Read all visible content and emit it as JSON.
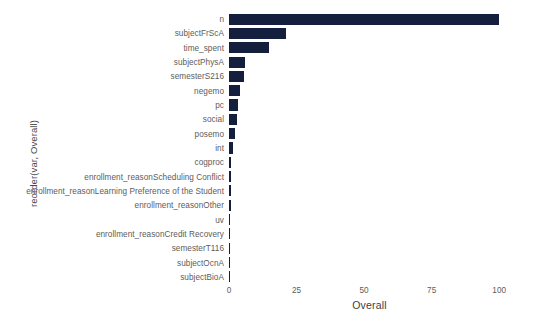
{
  "chart_data": {
    "type": "bar",
    "orientation": "horizontal",
    "title": "",
    "xlabel": "Overall",
    "ylabel": "reorder(var, Overall)",
    "xlim": [
      0,
      104
    ],
    "xticks": [
      0,
      25,
      50,
      75,
      100
    ],
    "xtick_labels": [
      "0",
      "25",
      "50",
      "75",
      "100"
    ],
    "grid": false,
    "legend": null,
    "bar_color": "#131f3d",
    "background_color": "#ffffff",
    "categories": [
      "n",
      "subjectFrScA",
      "time_spent",
      "subjectPhysA",
      "semesterS216",
      "negemo",
      "pc",
      "social",
      "posemo",
      "int",
      "cogproc",
      "enrollment_reasonScheduling Conflict",
      "enrollment_reasonLearning Preference of the Student",
      "enrollment_reasonOther",
      "uv",
      "enrollment_reasonCredit Recovery",
      "semesterT116",
      "subjectOcnA",
      "subjectBioA"
    ],
    "values": [
      100.0,
      21.2,
      14.8,
      6.1,
      5.5,
      4.0,
      3.3,
      3.0,
      2.4,
      1.4,
      0.8,
      0.7,
      0.7,
      0.6,
      0.5,
      0.5,
      0.4,
      0.3,
      0.0
    ]
  }
}
